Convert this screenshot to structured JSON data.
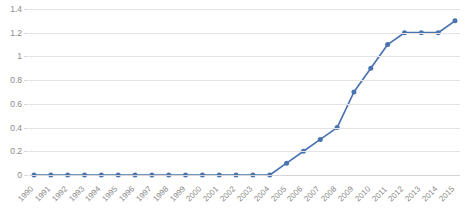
{
  "chart_data": {
    "type": "line",
    "title": "",
    "title_note": "chart title is cropped off the top edge of the screenshot and is illegible",
    "xlabel": "",
    "ylabel": "",
    "categories": [
      "1990",
      "1991",
      "1992",
      "1993",
      "1994",
      "1995",
      "1996",
      "1997",
      "1998",
      "1999",
      "2000",
      "2001",
      "2002",
      "2003",
      "2004",
      "2005",
      "2006",
      "2007",
      "2008",
      "2009",
      "2010",
      "2011",
      "2012",
      "2013",
      "2014",
      "2015"
    ],
    "values": [
      0,
      0,
      0,
      0,
      0,
      0,
      0,
      0,
      0,
      0,
      0,
      0,
      0,
      0,
      0,
      0.1,
      0.2,
      0.3,
      0.4,
      0.7,
      0.9,
      1.1,
      1.2,
      1.2,
      1.2,
      1.3
    ],
    "series": [
      {
        "name": "Series 1",
        "values": [
          0,
          0,
          0,
          0,
          0,
          0,
          0,
          0,
          0,
          0,
          0,
          0,
          0,
          0,
          0,
          0.1,
          0.2,
          0.3,
          0.4,
          0.7,
          0.9,
          1.1,
          1.2,
          1.2,
          1.2,
          1.3
        ]
      }
    ],
    "ylim": [
      0,
      1.4
    ],
    "ytick_labels": [
      "1.4",
      "1.2",
      "1",
      "0.8",
      "0.6",
      "0.4",
      "0.2",
      "0"
    ],
    "ytick_values": [
      1.4,
      1.2,
      1.0,
      0.8,
      0.6,
      0.4,
      0.2,
      0
    ],
    "ytick_step": 0.2,
    "grid": "horizontal",
    "legend": "none",
    "marker": "circle",
    "colors": {
      "series_line": "#4a74b0",
      "series_marker": "#4a74b0",
      "gridline": "#e3e3e3",
      "axis_text": "#8a8a8a",
      "background": "#ffffff"
    }
  }
}
